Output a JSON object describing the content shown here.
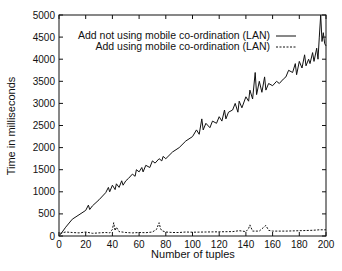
{
  "chart_data": {
    "type": "line",
    "title": "",
    "xlabel": "Number of tuples",
    "ylabel": "Time in milliseconds",
    "xlim": [
      0,
      200
    ],
    "ylim": [
      0,
      5000
    ],
    "xticks": [
      0,
      20,
      40,
      60,
      80,
      100,
      120,
      140,
      160,
      180,
      200
    ],
    "yticks": [
      0,
      500,
      1000,
      1500,
      2000,
      2500,
      3000,
      3500,
      4000,
      4500,
      5000
    ],
    "grid": false,
    "legend_position": "upper-left-center",
    "series": [
      {
        "name": "Add not using mobile co-ordination (LAN)",
        "style": "solid",
        "x": [
          1,
          5,
          10,
          15,
          20,
          22,
          23,
          25,
          30,
          35,
          37,
          38,
          40,
          42,
          43,
          45,
          47,
          48,
          50,
          52,
          55,
          57,
          58,
          60,
          62,
          63,
          65,
          68,
          70,
          72,
          75,
          77,
          78,
          80,
          85,
          90,
          95,
          100,
          103,
          105,
          107,
          108,
          110,
          113,
          115,
          118,
          120,
          122,
          124,
          125,
          127,
          130,
          132,
          134,
          135,
          137,
          140,
          142,
          143,
          145,
          147,
          148,
          150,
          152,
          154,
          155,
          157,
          160,
          163,
          165,
          168,
          170,
          172,
          175,
          177,
          178,
          180,
          182,
          184,
          185,
          187,
          188,
          190,
          191,
          193,
          194,
          195,
          196,
          197,
          198,
          199,
          200
        ],
        "y": [
          30,
          200,
          380,
          480,
          580,
          700,
          600,
          680,
          820,
          980,
          1100,
          1000,
          1150,
          1050,
          1180,
          1100,
          1250,
          1150,
          1250,
          1300,
          1400,
          1350,
          1500,
          1450,
          1550,
          1450,
          1600,
          1550,
          1700,
          1650,
          1750,
          1700,
          1800,
          1750,
          1900,
          2000,
          2150,
          2250,
          2400,
          2300,
          2650,
          2400,
          2550,
          2450,
          2600,
          2550,
          2700,
          2600,
          2850,
          2650,
          2800,
          2850,
          3000,
          2800,
          3050,
          2900,
          3150,
          3050,
          3300,
          3100,
          3700,
          3200,
          3500,
          3250,
          3600,
          3300,
          3450,
          3400,
          3500,
          3450,
          3550,
          3600,
          3750,
          3700,
          3900,
          3650,
          3950,
          3800,
          4100,
          3850,
          4000,
          3900,
          4150,
          3950,
          4250,
          4000,
          4500,
          5000,
          4400,
          4600,
          4350,
          4300
        ]
      },
      {
        "name": "Add using mobile co-ordination (LAN)",
        "style": "dashed",
        "x": [
          1,
          5,
          10,
          15,
          20,
          25,
          30,
          35,
          38,
          40,
          41,
          42,
          43,
          45,
          50,
          55,
          60,
          65,
          70,
          73,
          75,
          76,
          77,
          80,
          85,
          90,
          95,
          100,
          110,
          120,
          130,
          135,
          140,
          142,
          143,
          145,
          150,
          153,
          155,
          156,
          157,
          160,
          170,
          180,
          190,
          195,
          200
        ],
        "y": [
          60,
          90,
          80,
          70,
          90,
          60,
          70,
          80,
          70,
          150,
          300,
          120,
          200,
          100,
          80,
          70,
          80,
          75,
          90,
          150,
          300,
          170,
          120,
          90,
          80,
          80,
          90,
          85,
          90,
          95,
          100,
          120,
          100,
          170,
          250,
          110,
          110,
          190,
          240,
          180,
          130,
          110,
          110,
          120,
          130,
          140,
          140
        ]
      }
    ]
  },
  "legend": {
    "items": [
      {
        "label": "Add not using mobile co-ordination (LAN)",
        "style": "solid"
      },
      {
        "label": "Add using mobile co-ordination (LAN)",
        "style": "dashed"
      }
    ]
  },
  "axes": {
    "xlabel": "Number of tuples",
    "ylabel": "Time in milliseconds"
  }
}
